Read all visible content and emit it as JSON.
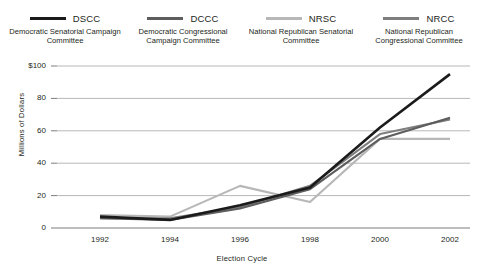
{
  "chart_data": {
    "type": "line",
    "title": "",
    "xlabel": "Election Cycle",
    "ylabel": "Millions of Dollars",
    "categories": [
      "1992",
      "1994",
      "1996",
      "1998",
      "2000",
      "2002"
    ],
    "x": [
      1992,
      1994,
      1996,
      1998,
      2000,
      2002
    ],
    "ylim": [
      0,
      100
    ],
    "yticks": [
      0,
      20,
      40,
      60,
      80,
      100
    ],
    "ytick_labels": [
      "0",
      "20",
      "40",
      "60",
      "80",
      "$100"
    ],
    "grid": "horizontal",
    "legend_position": "top",
    "series": [
      {
        "name": "DSCC",
        "label": "DSCC",
        "description": "Democratic Senatorial Campaign Committee",
        "color": "#1b1b1b",
        "values": [
          7,
          5,
          14,
          25,
          62,
          95
        ]
      },
      {
        "name": "DCCC",
        "label": "DCCC",
        "description": "Democratic Congressional Campaign Committee",
        "color": "#5d5d5d",
        "values": [
          6,
          5,
          12,
          24,
          55,
          68
        ]
      },
      {
        "name": "NRSC",
        "label": "NRSC",
        "description": "National Republican Senatorial Committee",
        "color": "#b7b7b7",
        "values": [
          8,
          7,
          26,
          16,
          55,
          55
        ]
      },
      {
        "name": "NRCC",
        "label": "NRCC",
        "description": "National Republican Congressional Committee",
        "color": "#7e7e7e",
        "values": [
          6,
          6,
          13,
          26,
          58,
          67
        ]
      }
    ]
  },
  "legend": {
    "items": [
      {
        "abbr": "DSCC",
        "desc": "Democratic Senatorial Campaign Committee",
        "color": "#1b1b1b"
      },
      {
        "abbr": "DCCC",
        "desc": "Democratic Congressional Campaign Committee",
        "color": "#5d5d5d"
      },
      {
        "abbr": "NRSC",
        "desc": "National Republican Senatorial Committee",
        "color": "#b7b7b7"
      },
      {
        "abbr": "NRCC",
        "desc": "National Republican Congressional Committee",
        "color": "#7e7e7e"
      }
    ]
  },
  "axes": {
    "y_title": "Millions of Dollars",
    "x_title": "Election Cycle"
  }
}
